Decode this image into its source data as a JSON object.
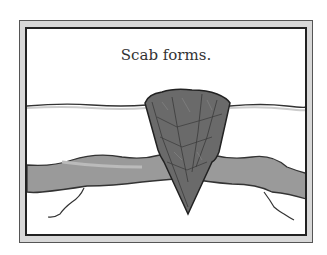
{
  "illustration": {
    "caption": "Scab forms.",
    "colors": {
      "frame_fill": "#d8d8d8",
      "frame_line": "#222222",
      "scab": "#6a6a6a",
      "vessel": "#9a9a9a",
      "background": "#ffffff"
    }
  }
}
